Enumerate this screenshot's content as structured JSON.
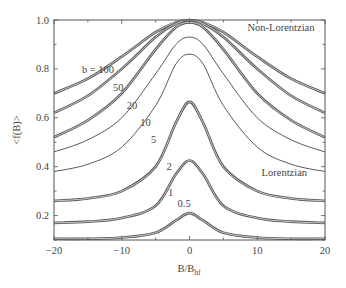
{
  "chart_data": {
    "type": "line",
    "title": "",
    "xlabel": "B/B",
    "xlabel_subscript": "hf",
    "ylabel": "<f(B)>",
    "xlim": [
      -20,
      20
    ],
    "ylim": [
      0.1,
      1.0
    ],
    "xticks": [
      -20,
      -10,
      0,
      10,
      20
    ],
    "xtick_labels": [
      "−20",
      "−10",
      "0",
      "10",
      "20"
    ],
    "xminor_step": 5,
    "yticks": [
      0.2,
      0.4,
      0.6,
      0.8,
      1.0
    ],
    "ytick_labels": [
      "0.2",
      "0.4",
      "0.6",
      "0.8",
      "1.0"
    ],
    "yminor_step": 0.1,
    "grid": false,
    "annotations": [
      {
        "text": "Non-Lorentzian",
        "x": 13.5,
        "y": 0.955
      },
      {
        "text": "Lorentzian",
        "x": 14,
        "y": 0.36
      }
    ],
    "x": [
      -20,
      -15,
      -10,
      -5,
      -2,
      0,
      2,
      5,
      10,
      15,
      20
    ],
    "series": [
      {
        "name": "b = 100",
        "label": "b = 100",
        "label_pos": [
          -13.5,
          0.785
        ],
        "style": "double",
        "values": [
          0.7,
          0.76,
          0.85,
          0.95,
          0.99,
          1.0,
          0.99,
          0.95,
          0.85,
          0.76,
          0.7
        ]
      },
      {
        "name": "50",
        "label": "50",
        "label_pos": [
          -10.5,
          0.71
        ],
        "style": "double",
        "values": [
          0.62,
          0.69,
          0.8,
          0.93,
          0.985,
          1.0,
          0.985,
          0.93,
          0.8,
          0.69,
          0.62
        ]
      },
      {
        "name": "20",
        "label": "20",
        "label_pos": [
          -8.5,
          0.635
        ],
        "style": "double",
        "values": [
          0.52,
          0.59,
          0.7,
          0.88,
          0.97,
          0.99,
          0.97,
          0.88,
          0.7,
          0.59,
          0.52
        ]
      },
      {
        "name": "10",
        "label": "10",
        "label_pos": [
          -6.5,
          0.565
        ],
        "style": "single",
        "values": [
          0.46,
          0.51,
          0.6,
          0.78,
          0.9,
          0.93,
          0.9,
          0.78,
          0.6,
          0.51,
          0.46
        ]
      },
      {
        "name": "5",
        "label": "5",
        "label_pos": [
          -5.3,
          0.495
        ],
        "style": "single",
        "values": [
          0.38,
          0.41,
          0.48,
          0.65,
          0.82,
          0.86,
          0.82,
          0.65,
          0.48,
          0.41,
          0.38
        ]
      },
      {
        "name": "2",
        "label": "2",
        "label_pos": [
          -3.0,
          0.385
        ],
        "style": "double",
        "values": [
          0.26,
          0.27,
          0.3,
          0.4,
          0.58,
          0.665,
          0.58,
          0.4,
          0.3,
          0.27,
          0.26
        ]
      },
      {
        "name": "1",
        "label": "1",
        "label_pos": [
          -2.8,
          0.28
        ],
        "style": "double",
        "values": [
          0.17,
          0.175,
          0.19,
          0.24,
          0.37,
          0.425,
          0.37,
          0.24,
          0.19,
          0.175,
          0.17
        ]
      },
      {
        "name": "0.5",
        "label": "0.5",
        "label_pos": [
          -0.8,
          0.235
        ],
        "style": "double",
        "values": [
          0.105,
          0.105,
          0.11,
          0.13,
          0.18,
          0.21,
          0.18,
          0.13,
          0.11,
          0.105,
          0.105
        ]
      }
    ]
  }
}
